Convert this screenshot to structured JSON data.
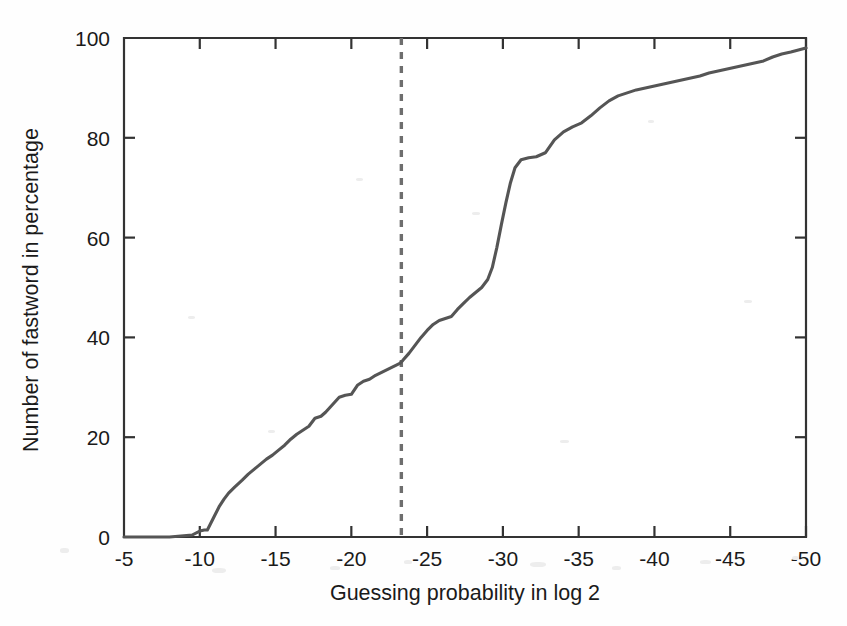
{
  "chart_data": {
    "type": "line",
    "title": "",
    "subtitle": "",
    "xlabel": "Guessing probability in log 2",
    "ylabel": "Number of fastword in percentage",
    "xlim": [
      -5,
      -50
    ],
    "ylim": [
      0,
      100
    ],
    "x_ticks": [
      "-5",
      "-10",
      "-15",
      "-20",
      "-25",
      "-30",
      "-35",
      "-40",
      "-45",
      "-50"
    ],
    "x_tick_values": [
      -5,
      -10,
      -15,
      -20,
      -25,
      -30,
      -35,
      -40,
      -45,
      -50
    ],
    "y_ticks": [
      "0",
      "20",
      "40",
      "60",
      "80",
      "100"
    ],
    "y_tick_values": [
      0,
      20,
      40,
      60,
      80,
      100
    ],
    "grid": false,
    "legend": null,
    "legend_position": "none",
    "x_axis_direction": "decreasing",
    "line_color": "#555555",
    "annotation_color": "#6e6e6e",
    "axis_color": "#333333",
    "series": [
      {
        "name": "cumulative fastword percentage",
        "style": "solid",
        "color": "#555555",
        "x": [
          -5.0,
          -8.0,
          -9.5,
          -10.0,
          -10.3,
          -10.5,
          -10.7,
          -11.0,
          -11.3,
          -11.6,
          -11.9,
          -12.3,
          -12.8,
          -13.2,
          -13.6,
          -14.0,
          -14.4,
          -14.8,
          -15.2,
          -15.6,
          -16.0,
          -16.4,
          -16.8,
          -17.2,
          -17.6,
          -18.0,
          -18.3,
          -18.6,
          -18.9,
          -19.2,
          -19.6,
          -20.0,
          -20.4,
          -20.8,
          -21.2,
          -21.6,
          -22.0,
          -22.4,
          -22.8,
          -23.2,
          -23.4,
          -23.8,
          -24.2,
          -24.6,
          -25.0,
          -25.4,
          -25.8,
          -26.2,
          -26.6,
          -27.0,
          -27.4,
          -27.8,
          -28.2,
          -28.6,
          -29.0,
          -29.3,
          -29.6,
          -29.9,
          -30.2,
          -30.5,
          -30.8,
          -31.2,
          -31.7,
          -32.2,
          -32.8,
          -33.4,
          -34.0,
          -34.6,
          -35.2,
          -35.8,
          -36.4,
          -37.0,
          -37.6,
          -38.2,
          -38.8,
          -39.4,
          -40.0,
          -40.6,
          -41.2,
          -41.8,
          -42.4,
          -43.0,
          -43.6,
          -44.2,
          -44.8,
          -45.4,
          -46.0,
          -46.6,
          -47.2,
          -47.8,
          -48.4,
          -49.0,
          -49.5,
          -50.0
        ],
        "y": [
          0.0,
          0.0,
          0.4,
          1.2,
          1.4,
          1.4,
          2.6,
          4.4,
          6.2,
          7.6,
          8.8,
          10.0,
          11.4,
          12.6,
          13.6,
          14.6,
          15.6,
          16.4,
          17.4,
          18.4,
          19.6,
          20.6,
          21.4,
          22.2,
          23.8,
          24.2,
          25.0,
          26.0,
          27.0,
          28.0,
          28.4,
          28.6,
          30.4,
          31.2,
          31.6,
          32.4,
          33.0,
          33.6,
          34.2,
          34.8,
          35.4,
          36.8,
          38.4,
          40.0,
          41.4,
          42.6,
          43.4,
          43.8,
          44.2,
          45.6,
          46.8,
          48.0,
          49.0,
          50.0,
          51.6,
          54.0,
          58.0,
          62.6,
          67.0,
          71.0,
          74.0,
          75.6,
          76.0,
          76.2,
          77.0,
          79.6,
          81.2,
          82.2,
          83.0,
          84.4,
          86.0,
          87.4,
          88.4,
          89.0,
          89.6,
          90.0,
          90.4,
          90.8,
          91.2,
          91.6,
          92.0,
          92.4,
          93.0,
          93.4,
          93.8,
          94.2,
          94.6,
          95.0,
          95.4,
          96.2,
          96.8,
          97.2,
          97.6,
          98.0
        ]
      }
    ],
    "annotations": [
      {
        "type": "vertical-line",
        "style": "dashed",
        "x": -23.3,
        "color": "#6e6e6e",
        "label": ""
      }
    ]
  }
}
